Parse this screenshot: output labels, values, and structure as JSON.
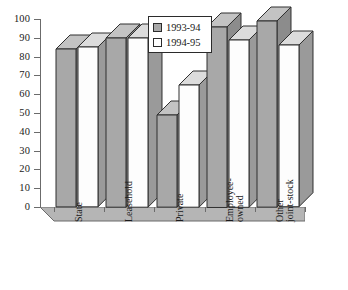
{
  "chart_data": {
    "type": "bar",
    "title": "",
    "subtitle": "",
    "xlabel": "",
    "ylabel": "",
    "ylim": [
      0,
      100
    ],
    "ytick_step": 10,
    "yticks": [
      100,
      90,
      80,
      70,
      60,
      50,
      40,
      30,
      20,
      10,
      0
    ],
    "grid": false,
    "style": "3d-grouped-column",
    "legend_position": "inside-top-center",
    "categories": [
      "State",
      "Leasehold",
      "Private",
      "Employee-owned",
      "Other joint-stock"
    ],
    "category_lines": [
      [
        "State"
      ],
      [
        "Leasehold"
      ],
      [
        "Private"
      ],
      [
        "Employee-",
        "owned"
      ],
      [
        "Other",
        "joint-stock"
      ]
    ],
    "series": [
      {
        "name": "1993-94",
        "color": "#a8a8a8",
        "values": [
          84,
          90,
          49,
          96,
          99
        ]
      },
      {
        "name": "1994-95",
        "color": "#ffffff",
        "values": [
          85,
          90,
          65,
          89,
          86
        ]
      }
    ]
  },
  "legend": {
    "items": [
      {
        "label": "1993-94",
        "swatch": "gray"
      },
      {
        "label": "1994-95",
        "swatch": "white"
      }
    ]
  },
  "axis": {
    "y_tick_labels": [
      "100",
      "90",
      "80",
      "70",
      "60",
      "50",
      "40",
      "30",
      "20",
      "10",
      "0"
    ]
  },
  "colors": {
    "series_a_face": "#a8a8a8",
    "series_a_top": "#c3c3c3",
    "series_a_side": "#8c8c8c",
    "series_b_face": "#fdfdfd",
    "series_b_top": "#dcdcdc",
    "series_b_side": "#9a9a9a",
    "outline": "#2f2f2f",
    "axis": "#6b6b6b",
    "floor": "#b5b5b5",
    "text": "#1a1a1a"
  }
}
